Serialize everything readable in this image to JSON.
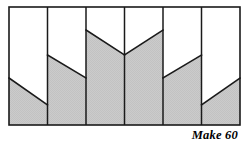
{
  "figure": {
    "caption": "Make 60",
    "frame": {
      "x": 9,
      "y": 7,
      "width": 231,
      "height": 118,
      "stroke": "#1a1a1a",
      "stroke_width": 1.6
    },
    "colors": {
      "fill_shaded": "#c9c9c9",
      "fill_empty": "#ffffff",
      "outline": "#1a1a1a",
      "divider": "#1a1a1a",
      "background": "#ffffff",
      "text": "#000000"
    },
    "column_count": 6,
    "column_width": 38.5,
    "columns": [
      {
        "index": 1,
        "name": "column-1",
        "x_left": 9,
        "x_right": 47.5,
        "diagonal_y_left": 78,
        "diagonal_y_right": 105,
        "slope": "down-right",
        "shaded_region": "below-diagonal"
      },
      {
        "index": 2,
        "name": "column-2",
        "x_left": 47.5,
        "x_right": 86,
        "diagonal_y_left": 55,
        "diagonal_y_right": 78,
        "slope": "down-right",
        "shaded_region": "below-diagonal"
      },
      {
        "index": 3,
        "name": "column-3",
        "x_left": 86,
        "x_right": 124.5,
        "diagonal_y_left": 30,
        "diagonal_y_right": 55,
        "slope": "down-right",
        "shaded_region": "below-diagonal"
      },
      {
        "index": 4,
        "name": "column-4",
        "x_left": 124.5,
        "x_right": 163,
        "diagonal_y_left": 55,
        "diagonal_y_right": 30,
        "slope": "up-right",
        "shaded_region": "below-diagonal"
      },
      {
        "index": 5,
        "name": "column-5",
        "x_left": 163,
        "x_right": 201.5,
        "diagonal_y_left": 78,
        "diagonal_y_right": 55,
        "slope": "up-right",
        "shaded_region": "below-diagonal"
      },
      {
        "index": 6,
        "name": "column-6",
        "x_left": 201.5,
        "x_right": 240,
        "diagonal_y_left": 105,
        "diagonal_y_right": 78,
        "slope": "up-right",
        "shaded_region": "below-diagonal"
      }
    ],
    "dividers_x": [
      47.5,
      86,
      124.5,
      163,
      201.5
    ]
  }
}
